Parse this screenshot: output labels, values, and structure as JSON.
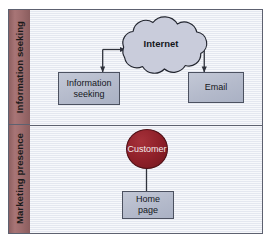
{
  "diagram": {
    "colors": {
      "band_fill": "#9c6b6c",
      "canvas_fill": "#eef0f6",
      "box_fill": "#b9bfcf",
      "cloud_fill": "#c9ccdb",
      "circle_fill": "#8d1f28",
      "stroke": "#4c5160",
      "frame_stroke": "#5d6170",
      "box_text": "#15171c",
      "circle_text": "#f2eaea",
      "band_text": "#1b1b1b"
    },
    "lanes": [
      {
        "id": "lane-information-seeking",
        "label": "Information seeking"
      },
      {
        "id": "lane-marketing-presence",
        "label": "Marketing presence"
      }
    ],
    "nodes": [
      {
        "id": "node-internet",
        "label": "Internet",
        "shape": "cloud",
        "lane": "lane-information-seeking"
      },
      {
        "id": "node-information-seeking",
        "label": "Information seeking",
        "shape": "rectangle",
        "lane": "lane-information-seeking"
      },
      {
        "id": "node-email",
        "label": "Email",
        "shape": "rectangle",
        "lane": "lane-information-seeking"
      },
      {
        "id": "node-customer",
        "label": "Customer",
        "shape": "ellipse",
        "lane": "lane-marketing-presence"
      },
      {
        "id": "node-home-page",
        "label": "Home page",
        "shape": "rectangle",
        "lane": "lane-marketing-presence"
      }
    ],
    "connectors": [
      {
        "id": "connector-information-seeking-internet",
        "from": "node-information-seeking",
        "to": "node-internet",
        "style": "elbow",
        "arrows": "both"
      },
      {
        "id": "connector-email-internet",
        "from": "node-email",
        "to": "node-internet",
        "style": "elbow",
        "arrows": "both"
      },
      {
        "id": "connector-home-page-customer",
        "from": "node-home-page",
        "to": "node-customer",
        "style": "straight",
        "arrows": "end"
      }
    ]
  }
}
